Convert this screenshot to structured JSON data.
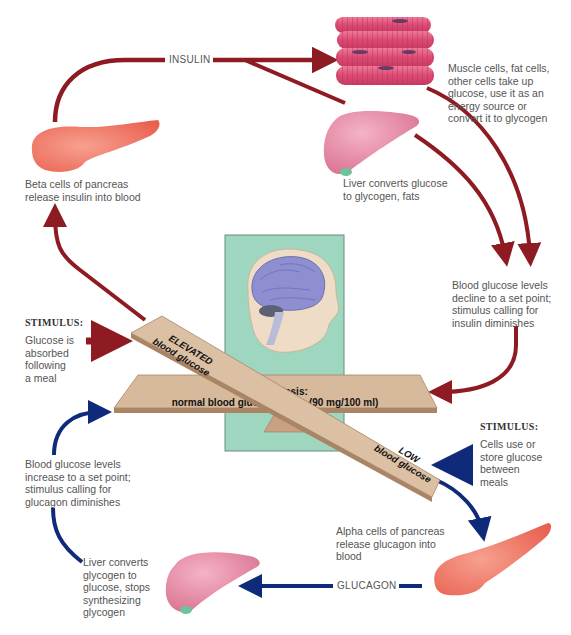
{
  "colors": {
    "insulin_arrow": "#8e1b22",
    "glucagon_arrow": "#0f2a7a",
    "panel_bg": "#9fd6bf",
    "board": "#d7b99b",
    "board_edge": "#a98566",
    "pancreas": "#f07a68",
    "muscle": "#e05378",
    "liver": "#e68aa6",
    "brain": "#8d8fd0",
    "text": "#555555"
  },
  "insulin_pathway": {
    "hormone_label": "INSULIN",
    "beta_cells": "Beta cells of pancreas\nrelease insulin into blood",
    "muscle_cells": "Muscle cells, fat cells,\nother cells take up\nglucose, use it as an\nenergy source or\nconvert it to glycogen",
    "liver": "Liver converts glucose\nto glycogen, fats",
    "decline": "Blood glucose levels\ndecline to a set point;\nstimulus calling for\ninsulin diminishes"
  },
  "stimulus_high": {
    "heading": "STIMULUS:",
    "text": "Glucose is\nabsorbed\nfollowing\na meal"
  },
  "stimulus_low": {
    "heading": "STIMULUS:",
    "text": "Cells use or\nstore glucose\nbetween\nmeals"
  },
  "seesaw": {
    "elevated_line1": "ELEVATED",
    "elevated_line2": "blood glucose",
    "homeostasis_line1": "Homeostasis:",
    "homeostasis_line2": "normal blood glucose levels (90 mg/100 ml)",
    "low_line1": "LOW",
    "low_line2": "blood glucose"
  },
  "glucagon_pathway": {
    "hormone_label": "GLUCAGON",
    "alpha_cells": "Alpha cells of pancreas\nrelease glucagon into\nblood",
    "liver": "Liver converts\nglycogen to\nglucose, stops\nsynthesizing\nglycogen",
    "increase": "Blood glucose levels\nincrease to a set point;\nstimulus calling for\nglucagon diminishes"
  }
}
